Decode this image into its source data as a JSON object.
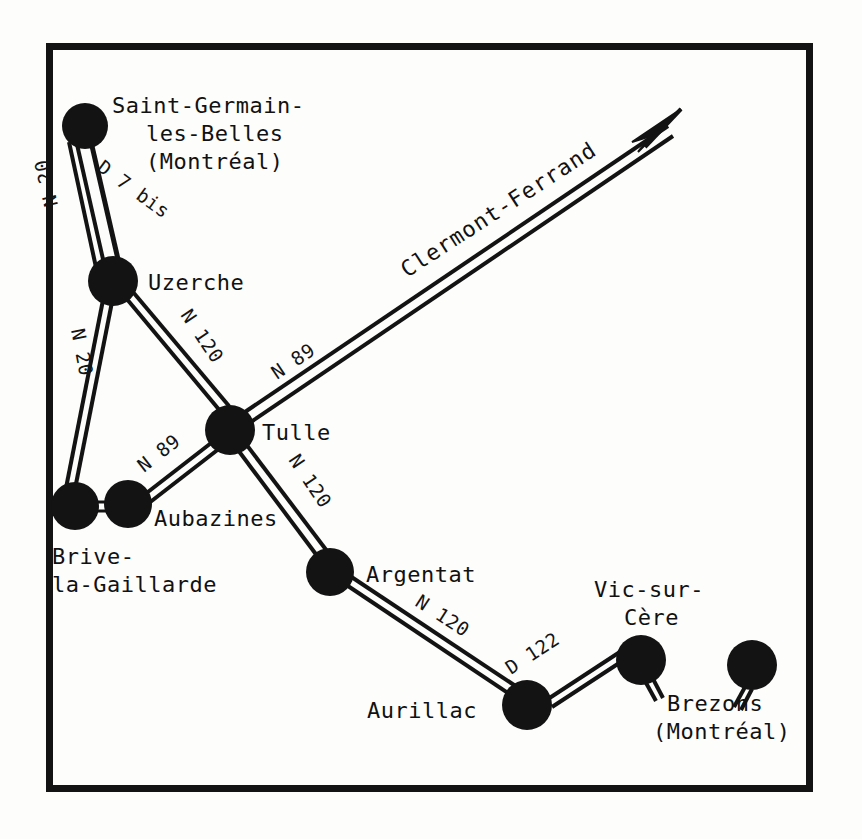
{
  "figure": {
    "kind": "road-network-map",
    "background_color": "#fdfdfc",
    "ink_color": "#111111",
    "frame": {
      "x": 46,
      "y": 43,
      "width": 766,
      "height": 748,
      "stroke_width": 7
    }
  },
  "nodes": [
    {
      "id": "saint-germain",
      "label_lines": [
        "Saint-Germain-",
        "les-Belles",
        "(Montréal)"
      ],
      "label_line1": "Saint-Germain-",
      "label_line2": "les-Belles",
      "label_line3": "(Montréal)",
      "x": 85,
      "y": 126,
      "r": 22
    },
    {
      "id": "uzerche",
      "label": "Uzerche",
      "x": 113,
      "y": 281,
      "r": 24
    },
    {
      "id": "tulle",
      "label": "Tulle",
      "x": 230,
      "y": 430,
      "r": 24
    },
    {
      "id": "brive",
      "label_line1": "Brive-",
      "label_line2": "la-Gaillarde",
      "x": 75,
      "y": 506,
      "r": 23
    },
    {
      "id": "aubazines",
      "label": "Aubazines",
      "x": 128,
      "y": 504,
      "r": 23
    },
    {
      "id": "argentat",
      "label": "Argentat",
      "x": 330,
      "y": 572,
      "r": 23
    },
    {
      "id": "aurillac",
      "label": "Aurillac",
      "x": 527,
      "y": 705,
      "r": 24
    },
    {
      "id": "vic-sur-cere",
      "label_line1": "Vic-sur-",
      "label_line2": "Cère",
      "x": 641,
      "y": 660,
      "r": 24
    },
    {
      "id": "brezons",
      "label_line1": "Brezons",
      "label_line2": "(Montréal)",
      "x": 752,
      "y": 665,
      "r": 24
    }
  ],
  "roads": [
    {
      "id": "d7bis",
      "label": "D 7 bis",
      "from": "saint-germain",
      "to": "uzerche",
      "style": "single"
    },
    {
      "id": "n20",
      "label": "N 20",
      "from": "saint-germain-stub",
      "to": "brive",
      "style": "double"
    },
    {
      "id": "n20-uzerche-brive",
      "label": "N 20",
      "from": "uzerche",
      "to": "brive",
      "style": "double"
    },
    {
      "id": "n120-uzerche-tulle",
      "label": "N 120",
      "from": "uzerche",
      "to": "tulle",
      "style": "double"
    },
    {
      "id": "n89-aubazines-tulle",
      "label": "N 89",
      "from": "aubazines",
      "to": "tulle",
      "style": "double"
    },
    {
      "id": "n89-tulle-clermont",
      "label": "N 89",
      "from": "tulle",
      "to": "clermont-ferrand",
      "style": "double"
    },
    {
      "id": "n120-tulle-argentat",
      "label": "N 120",
      "from": "tulle",
      "to": "argentat",
      "style": "double"
    },
    {
      "id": "n120-argentat-aurillac",
      "label": "N 120",
      "from": "argentat",
      "to": "aurillac",
      "style": "double"
    },
    {
      "id": "d122-aurillac-vic",
      "label": "D 122",
      "from": "aurillac",
      "to": "vic-sur-cere",
      "style": "double"
    },
    {
      "id": "brive-aubazines-link",
      "label": "",
      "from": "brive",
      "to": "aubazines",
      "style": "double-short"
    }
  ],
  "destination_arrow": {
    "label": "Clermont-Ferrand",
    "from_node": "tulle",
    "tip_x": 681,
    "tip_y": 109,
    "rotation_deg": -32
  },
  "road_labels": {
    "d7bis": "D 7 bis",
    "n20_upper": "N 20",
    "n20_lower": "N 20",
    "n120_uzerche_tulle": "N 120",
    "n89_tulle_up": "N 89",
    "n89_aubazines": "N 89",
    "n120_tulle_argentat": "N 120",
    "n120_argentat_aurillac": "N 120",
    "d122": "D 122"
  },
  "place_labels": {
    "saint_germain_1": "Saint-Germain-",
    "saint_germain_2": "les-Belles",
    "saint_germain_3": "(Montréal)",
    "uzerche": "Uzerche",
    "tulle": "Tulle",
    "aubazines": "Aubazines",
    "brive_1": "Brive-",
    "brive_2": "la-Gaillarde",
    "argentat": "Argentat",
    "aurillac": "Aurillac",
    "vic_1": "Vic-sur-",
    "vic_2": "Cère",
    "brezons_1": "Brezons",
    "brezons_2": "(Montréal)",
    "clermont_ferrand": "Clermont-Ferrand"
  }
}
